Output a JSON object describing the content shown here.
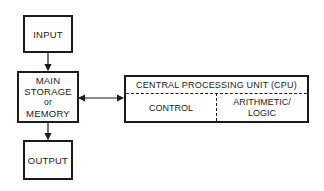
{
  "diagram": {
    "input_box": {
      "label": "INPUT"
    },
    "memory_box": {
      "lines": [
        "MAIN",
        "STORAGE",
        "or",
        "MEMORY"
      ]
    },
    "output_box": {
      "label": "OUTPUT"
    },
    "cpu_box": {
      "title": "CENTRAL PROCESSING UNIT (CPU)",
      "left_section": "CONTROL",
      "right_section": [
        "ARITHMETIC/",
        "LOGIC"
      ]
    },
    "connections": [
      {
        "from": "INPUT",
        "to": "MAIN STORAGE or MEMORY",
        "type": "arrow"
      },
      {
        "from": "MAIN STORAGE or MEMORY",
        "to": "OUTPUT",
        "type": "arrow"
      },
      {
        "from": "MAIN STORAGE or MEMORY",
        "to": "CENTRAL PROCESSING UNIT (CPU)",
        "type": "bidirectional-arrow"
      }
    ]
  }
}
